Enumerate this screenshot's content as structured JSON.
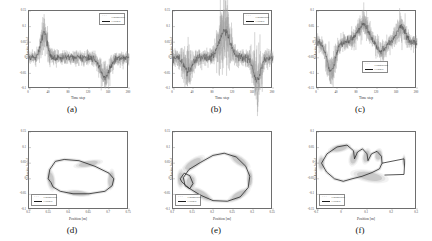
{
  "figure": {
    "panels": [
      {
        "id": "a",
        "caption": "(a)",
        "type": "timeseries",
        "xlabel": "Time step",
        "ylabel": "Velocity [m/s]",
        "xticks": [
          "0",
          "40",
          "80",
          "120",
          "160",
          "200"
        ],
        "yticks": [
          "0.15",
          "0.1",
          "0.05",
          "0",
          "-0.05",
          "-0.1"
        ],
        "xlim": [
          0,
          200
        ],
        "ylim": [
          -0.1,
          0.15
        ],
        "legend_pos": "top-right",
        "series": [
          {
            "name": "Groundtruth",
            "style": "dots"
          },
          {
            "name": "Learned",
            "style": "line"
          }
        ],
        "events": [
          {
            "center": 30,
            "amp": 0.082,
            "width": 9
          },
          {
            "center": 152,
            "amp": -0.062,
            "width": 13
          }
        ],
        "noise": 0.011
      },
      {
        "id": "b",
        "caption": "(b)",
        "type": "timeseries",
        "xlabel": "Time step",
        "ylabel": "Velocity [m/s]",
        "xticks": [
          "0",
          "40",
          "80",
          "120",
          "160",
          "200"
        ],
        "yticks": [
          "0.15",
          "0.1",
          "0.05",
          "0",
          "-0.05",
          "-0.1"
        ],
        "xlim": [
          0,
          200
        ],
        "ylim": [
          -0.1,
          0.15
        ],
        "legend_pos": "top-right",
        "series": [
          {
            "name": "Groundtruth",
            "style": "dots"
          },
          {
            "name": "Learned",
            "style": "line"
          }
        ],
        "events": [
          {
            "center": 30,
            "amp": -0.04,
            "width": 11
          },
          {
            "center": 103,
            "amp": 0.085,
            "width": 15
          },
          {
            "center": 168,
            "amp": -0.072,
            "width": 10
          }
        ],
        "noise": 0.013
      },
      {
        "id": "c",
        "caption": "(c)",
        "type": "timeseries",
        "xlabel": "Time step",
        "ylabel": "Velocity [m/s]",
        "xticks": [
          "0",
          "40",
          "80",
          "120",
          "160",
          "200"
        ],
        "yticks": [
          "0.1",
          "0.05",
          "0",
          "-0.05",
          "-0.1",
          "-0.15"
        ],
        "xlim": [
          0,
          200
        ],
        "ylim": [
          -0.15,
          0.1
        ],
        "legend_pos": "bottom-center",
        "series": [
          {
            "name": "Groundtruth",
            "style": "dots"
          },
          {
            "name": "Learned",
            "style": "line"
          }
        ],
        "events": [
          {
            "center": 28,
            "amp": -0.095,
            "width": 12
          },
          {
            "center": 92,
            "amp": 0.055,
            "width": 16
          },
          {
            "center": 128,
            "amp": -0.03,
            "width": 12
          },
          {
            "center": 168,
            "amp": 0.05,
            "width": 12
          }
        ],
        "noise": 0.012
      },
      {
        "id": "d",
        "caption": "(d)",
        "type": "phase",
        "xlabel": "Position [m]",
        "ylabel": "Velocity [m/s]",
        "xticks": [
          "0.5",
          "0.55",
          "0.6",
          "0.65",
          "0.7",
          "0.75"
        ],
        "yticks": [
          "0.15",
          "0.1",
          "0.05",
          "0",
          "-0.05",
          "-0.1"
        ],
        "xlim": [
          0.5,
          0.75
        ],
        "ylim": [
          -0.1,
          0.15
        ],
        "legend_pos": "bottom-left",
        "series": [
          {
            "name": "Groundtruth",
            "style": "dots"
          },
          {
            "name": "Learned",
            "style": "line"
          }
        ],
        "loop": [
          [
            0.555,
            -0.012
          ],
          [
            0.548,
            0.0
          ],
          [
            0.552,
            0.03
          ],
          [
            0.566,
            0.056
          ],
          [
            0.588,
            0.062
          ],
          [
            0.625,
            0.058
          ],
          [
            0.665,
            0.04
          ],
          [
            0.7,
            0.018
          ],
          [
            0.712,
            0.0
          ],
          [
            0.708,
            -0.022
          ],
          [
            0.69,
            -0.04
          ],
          [
            0.65,
            -0.048
          ],
          [
            0.61,
            -0.048
          ],
          [
            0.578,
            -0.04
          ],
          [
            0.56,
            -0.026
          ],
          [
            0.555,
            -0.012
          ]
        ],
        "blobs": [
          {
            "cx": 0.555,
            "cy": -0.004,
            "rx": 0.009,
            "ry": 0.03,
            "rot": -8
          },
          {
            "cx": 0.648,
            "cy": 0.048,
            "rx": 0.03,
            "ry": 0.01,
            "rot": -10
          },
          {
            "cx": 0.705,
            "cy": -0.002,
            "rx": 0.008,
            "ry": 0.028,
            "rot": 6
          },
          {
            "cx": 0.622,
            "cy": -0.046,
            "rx": 0.028,
            "ry": 0.009,
            "rot": 5
          }
        ]
      },
      {
        "id": "e",
        "caption": "(e)",
        "type": "phase",
        "xlabel": "Position [m]",
        "ylabel": "Velocity [m/s]",
        "xticks": [
          "0.1",
          "0.15",
          "0.2",
          "0.25",
          "0.3",
          "0.35"
        ],
        "yticks": [
          "0.15",
          "0.1",
          "0.05",
          "0",
          "-0.05",
          "-0.1"
        ],
        "xlim": [
          0.1,
          0.35
        ],
        "ylim": [
          -0.1,
          0.15
        ],
        "legend_pos": "bottom-left",
        "series": [
          {
            "name": "Groundtruth",
            "style": "dots"
          },
          {
            "name": "Learned",
            "style": "line"
          }
        ],
        "loop": [
          [
            0.118,
            0.0
          ],
          [
            0.128,
            0.018
          ],
          [
            0.142,
            0.01
          ],
          [
            0.15,
            -0.015
          ],
          [
            0.142,
            -0.032
          ],
          [
            0.13,
            -0.022
          ],
          [
            0.126,
            0.004
          ],
          [
            0.14,
            0.03
          ],
          [
            0.168,
            0.052
          ],
          [
            0.2,
            0.075
          ],
          [
            0.228,
            0.082
          ],
          [
            0.258,
            0.07
          ],
          [
            0.282,
            0.04
          ],
          [
            0.292,
            0.008
          ],
          [
            0.288,
            -0.028
          ],
          [
            0.268,
            -0.058
          ],
          [
            0.236,
            -0.072
          ],
          [
            0.2,
            -0.07
          ],
          [
            0.168,
            -0.052
          ],
          [
            0.14,
            -0.03
          ],
          [
            0.122,
            -0.01
          ],
          [
            0.118,
            0.0
          ]
        ],
        "blobs": [
          {
            "cx": 0.15,
            "cy": 0.048,
            "rx": 0.028,
            "ry": 0.013,
            "rot": -34
          },
          {
            "cx": 0.266,
            "cy": 0.058,
            "rx": 0.026,
            "ry": 0.013,
            "rot": 34
          },
          {
            "cx": 0.172,
            "cy": -0.05,
            "rx": 0.026,
            "ry": 0.012,
            "rot": 32
          },
          {
            "cx": 0.265,
            "cy": -0.052,
            "rx": 0.026,
            "ry": 0.012,
            "rot": -30
          },
          {
            "cx": 0.119,
            "cy": 0.0,
            "rx": 0.008,
            "ry": 0.026,
            "rot": 0
          },
          {
            "cx": 0.292,
            "cy": 0.0,
            "rx": 0.007,
            "ry": 0.026,
            "rot": 0
          },
          {
            "cx": 0.144,
            "cy": -0.01,
            "rx": 0.012,
            "ry": 0.022,
            "rot": 12
          }
        ]
      },
      {
        "id": "f",
        "caption": "(f)",
        "type": "phase",
        "xlabel": "Position [m]",
        "ylabel": "Velocity [m/s]",
        "xticks": [
          "-0.1",
          "0",
          "0.1",
          "0.2",
          "0.3"
        ],
        "yticks": [
          "0.1",
          "0.05",
          "0",
          "-0.05",
          "-0.1",
          "-0.15"
        ],
        "xlim": [
          -0.1,
          0.3
        ],
        "ylim": [
          -0.15,
          0.1
        ],
        "legend_pos": "bottom-left",
        "series": [
          {
            "name": "Groundtruth",
            "style": "dots"
          },
          {
            "name": "Learned",
            "style": "line"
          }
        ],
        "loop": [
          [
            -0.082,
            0.0
          ],
          [
            -0.06,
            0.03
          ],
          [
            -0.02,
            0.052
          ],
          [
            0.02,
            0.058
          ],
          [
            0.046,
            0.04
          ],
          [
            0.05,
            0.014
          ],
          [
            0.062,
            0.036
          ],
          [
            0.082,
            0.046
          ],
          [
            0.1,
            0.03
          ],
          [
            0.104,
            0.008
          ],
          [
            0.118,
            0.03
          ],
          [
            0.14,
            0.038
          ],
          [
            0.158,
            0.022
          ],
          [
            0.16,
            0.0
          ],
          [
            0.15,
            -0.018
          ],
          [
            0.12,
            -0.03
          ],
          [
            0.08,
            -0.042
          ],
          [
            0.04,
            -0.05
          ],
          [
            0.005,
            -0.058
          ],
          [
            -0.03,
            -0.05
          ],
          [
            -0.062,
            -0.028
          ],
          [
            -0.082,
            0.0
          ]
        ],
        "blobs": [
          {
            "cx": -0.01,
            "cy": 0.048,
            "rx": 0.038,
            "ry": 0.011,
            "rot": -12
          },
          {
            "cx": 0.11,
            "cy": -0.042,
            "rx": 0.062,
            "ry": 0.016,
            "rot": 10
          },
          {
            "cx": -0.083,
            "cy": 0.0,
            "rx": 0.012,
            "ry": 0.022,
            "rot": 0
          },
          {
            "cx": 0.048,
            "cy": 0.018,
            "rx": 0.016,
            "ry": 0.024,
            "rot": 18
          },
          {
            "cx": 0.098,
            "cy": 0.022,
            "rx": 0.014,
            "ry": 0.022,
            "rot": 14
          },
          {
            "cx": 0.146,
            "cy": 0.026,
            "rx": 0.014,
            "ry": 0.018,
            "rot": 10
          },
          {
            "cx": 0.248,
            "cy": 0.006,
            "rx": 0.006,
            "ry": 0.018,
            "rot": 0
          }
        ],
        "tail": [
          [
            0.16,
            0.0
          ],
          [
            0.248,
            0.014
          ],
          [
            0.25,
            -0.006
          ],
          [
            0.248,
            -0.036
          ],
          [
            0.17,
            -0.038
          ]
        ]
      }
    ]
  },
  "chart_data": {
    "type": "scatter",
    "title": "",
    "grid": false,
    "legend_entries": [
      "Groundtruth",
      "Learned"
    ],
    "panel_count": 6,
    "rows": 2,
    "cols": 3,
    "row_types": [
      "velocity-vs-timestep",
      "velocity-vs-position phase portrait"
    ],
    "colors": {
      "groundtruth_dots": "#9a9a9a",
      "learned_line": "#1c1c1c",
      "axis": "#6e6e6e",
      "background": "#ffffff"
    },
    "panels": [
      {
        "label": "(a)",
        "xlabel": "Time step",
        "ylabel": "Velocity [m/s]",
        "xlim": [
          0,
          200
        ],
        "ylim": [
          -0.1,
          0.15
        ],
        "xticks": [
          0,
          40,
          80,
          120,
          160,
          200
        ],
        "yticks": [
          -0.1,
          -0.05,
          0,
          0.05,
          0.1,
          0.15
        ],
        "peaks": [
          {
            "timestep": 30,
            "velocity": 0.082
          },
          {
            "timestep": 152,
            "velocity": -0.062
          }
        ],
        "baseline": 0.0,
        "noise_std": 0.011
      },
      {
        "label": "(b)",
        "xlabel": "Time step",
        "ylabel": "Velocity [m/s]",
        "xlim": [
          0,
          200
        ],
        "ylim": [
          -0.1,
          0.15
        ],
        "xticks": [
          0,
          40,
          80,
          120,
          160,
          200
        ],
        "yticks": [
          -0.1,
          -0.05,
          0,
          0.05,
          0.1,
          0.15
        ],
        "peaks": [
          {
            "timestep": 30,
            "velocity": -0.04
          },
          {
            "timestep": 103,
            "velocity": 0.085
          },
          {
            "timestep": 168,
            "velocity": -0.072
          }
        ],
        "baseline": 0.0,
        "noise_std": 0.013
      },
      {
        "label": "(c)",
        "xlabel": "Time step",
        "ylabel": "Velocity [m/s]",
        "xlim": [
          0,
          200
        ],
        "ylim": [
          -0.15,
          0.1
        ],
        "xticks": [
          0,
          40,
          80,
          120,
          160,
          200
        ],
        "yticks": [
          -0.15,
          -0.1,
          -0.05,
          0,
          0.05,
          0.1
        ],
        "peaks": [
          {
            "timestep": 28,
            "velocity": -0.095
          },
          {
            "timestep": 92,
            "velocity": 0.055
          },
          {
            "timestep": 128,
            "velocity": -0.03
          },
          {
            "timestep": 168,
            "velocity": 0.05
          }
        ],
        "baseline": 0.0,
        "noise_std": 0.012
      },
      {
        "label": "(d)",
        "xlabel": "Position [m]",
        "ylabel": "Velocity [m/s]",
        "xlim": [
          0.5,
          0.75
        ],
        "ylim": [
          -0.1,
          0.15
        ],
        "xticks": [
          0.5,
          0.55,
          0.6,
          0.65,
          0.7,
          0.75
        ],
        "yticks": [
          -0.1,
          -0.05,
          0,
          0.05,
          0.1,
          0.15
        ],
        "orbit_extent": {
          "position": [
            0.548,
            0.712
          ],
          "velocity": [
            -0.048,
            0.062
          ]
        }
      },
      {
        "label": "(e)",
        "xlabel": "Position [m]",
        "ylabel": "Velocity [m/s]",
        "xlim": [
          0.1,
          0.35
        ],
        "ylim": [
          -0.1,
          0.15
        ],
        "xticks": [
          0.1,
          0.15,
          0.2,
          0.25,
          0.3,
          0.35
        ],
        "yticks": [
          -0.1,
          -0.05,
          0,
          0.05,
          0.1,
          0.15
        ],
        "orbit_extent": {
          "position": [
            0.118,
            0.292
          ],
          "velocity": [
            -0.072,
            0.082
          ]
        }
      },
      {
        "label": "(f)",
        "xlabel": "Position [m]",
        "ylabel": "Velocity [m/s]",
        "xlim": [
          -0.1,
          0.3
        ],
        "ylim": [
          -0.15,
          0.1
        ],
        "xticks": [
          -0.1,
          0,
          0.1,
          0.2,
          0.3
        ],
        "yticks": [
          -0.15,
          -0.1,
          -0.05,
          0,
          0.05,
          0.1
        ],
        "orbit_extent": {
          "position": [
            -0.083,
            0.25
          ],
          "velocity": [
            -0.058,
            0.058
          ]
        }
      }
    ]
  }
}
